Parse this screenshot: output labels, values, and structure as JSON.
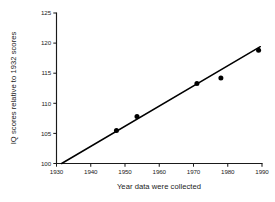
{
  "chart_data": {
    "type": "scatter",
    "title": "",
    "xlabel": "Year data were collected",
    "ylabel": "IQ scores relative to 1932 scores",
    "xlim": [
      1930,
      1990
    ],
    "ylim": [
      100,
      125
    ],
    "xticks": [
      1930,
      1940,
      1950,
      1960,
      1970,
      1980,
      1990
    ],
    "yticks": [
      100,
      105,
      110,
      115,
      120,
      125
    ],
    "xtick_labels": [
      "1930",
      "1940",
      "1950",
      "1960",
      "1970",
      "1980",
      "1990"
    ],
    "ytick_labels": [
      "100",
      "105",
      "110",
      "115",
      "120",
      "125"
    ],
    "grid": false,
    "legend": false,
    "legend_position": "none",
    "series": [
      {
        "name": "Observed IQ scores",
        "marker": "filled-circle",
        "color": "#000000",
        "x": [
          1947.5,
          1953.5,
          1971.0,
          1978.0,
          1989.0
        ],
        "y": [
          105.5,
          107.8,
          113.3,
          114.2,
          118.8
        ]
      },
      {
        "name": "Fitted trend line",
        "marker": "none",
        "style": "solid-line",
        "color": "#000000",
        "x": [
          1931.5,
          1989.5
        ],
        "y": [
          100.0,
          119.4
        ]
      }
    ]
  },
  "axes": {
    "x_axis_label": "Year data were collected",
    "y_axis_label": "IQ scores relative to 1932 scores"
  },
  "colors": {
    "background": "#ffffff",
    "ink": "#1a1a1a",
    "data": "#000000"
  }
}
